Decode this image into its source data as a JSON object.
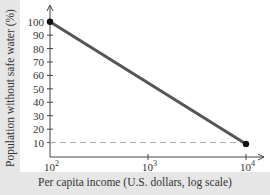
{
  "chart_data": {
    "type": "line",
    "title": "",
    "xlabel": "Per capita income (U.S. dollars, log scale)",
    "ylabel": "Population without safe water (%)",
    "x_scale": "log",
    "xlim": [
      100,
      10000
    ],
    "ylim": [
      0,
      100
    ],
    "x_ticks": [
      {
        "value": 100,
        "base": "10",
        "exp": "2"
      },
      {
        "value": 1000,
        "base": "10",
        "exp": "3"
      },
      {
        "value": 10000,
        "base": "10",
        "exp": "4"
      }
    ],
    "y_ticks": [
      10,
      20,
      30,
      40,
      50,
      60,
      70,
      80,
      90,
      100
    ],
    "series": [
      {
        "name": "Population without safe water",
        "x": [
          100,
          10000
        ],
        "y": [
          100,
          9
        ],
        "color": "#555555",
        "markers": "endpoints"
      }
    ],
    "reference_lines": [
      {
        "orientation": "horizontal",
        "y": 10,
        "style": "dashed",
        "color": "#aaaaaa"
      }
    ],
    "grid": false,
    "legend": "none"
  }
}
